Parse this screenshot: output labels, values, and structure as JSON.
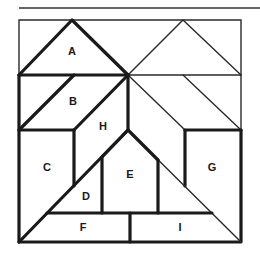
{
  "diagram": {
    "type": "tangram-square-puzzle",
    "pieces": [
      {
        "id": "A",
        "label": "A"
      },
      {
        "id": "B",
        "label": "B"
      },
      {
        "id": "C",
        "label": "C"
      },
      {
        "id": "D",
        "label": "D"
      },
      {
        "id": "E",
        "label": "E"
      },
      {
        "id": "F",
        "label": "F"
      },
      {
        "id": "G",
        "label": "G"
      },
      {
        "id": "H",
        "label": "H"
      },
      {
        "id": "I",
        "label": "I"
      }
    ],
    "colors": {
      "ink": "#1a1a1a",
      "background": "#ffffff"
    }
  }
}
